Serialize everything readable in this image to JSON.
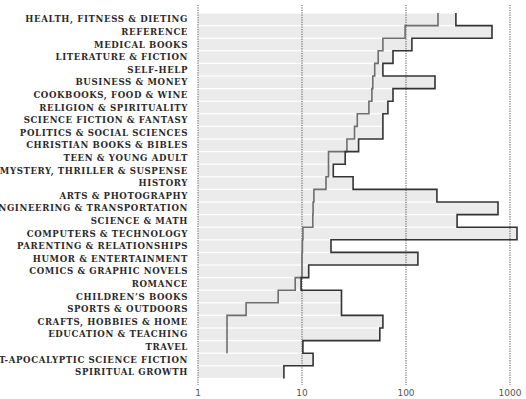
{
  "chart_data": {
    "type": "bar",
    "title": "",
    "xlabel": "",
    "ylabel": "",
    "xscale": "log",
    "xlim": [
      1,
      1000
    ],
    "x_ticks": [
      "1",
      "10",
      "100",
      "1000"
    ],
    "grid": "vertical dotted at each decade",
    "legend": "none",
    "categories": [
      "HEALTH, FITNESS & DIETING",
      "REFERENCE",
      "MEDICAL BOOKS",
      "LITERATURE & FICTION",
      "SELF-HELP",
      "BUSINESS & MONEY",
      "COOKBOOKS, FOOD & WINE",
      "RELIGION & SPIRITUALITY",
      "SCIENCE FICTION & FANTASY",
      "POLITICS & SOCIAL SCIENCES",
      "CHRISTIAN BOOKS & BIBLES",
      "TEEN & YOUNG ADULT",
      "MYSTERY, THRILLER & SUSPENSE",
      "HISTORY",
      "ARTS & PHOTOGRAPHY",
      "ENGINEERING & TRANSPORTATION",
      "SCIENCE & MATH",
      "COMPUTERS & TECHNOLOGY",
      "PARENTING & RELATIONSHIPS",
      "HUMOR & ENTERTAINMENT",
      "COMICS & GRAPHIC NOVELS",
      "ROMANCE",
      "CHILDREN’S BOOKS",
      "SPORTS & OUTDOORS",
      "CRAFTS, HOBBIES & HOME",
      "EDUCATION & TEACHING",
      "TRAVEL",
      "POST-APOCALYPTIC SCIENCE FICTION",
      "SPIRITUAL GROWTH"
    ],
    "series": [
      {
        "name": "gray step line",
        "color": "#6e6e6e",
        "values": [
          203,
          98,
          60,
          54,
          50,
          48,
          47,
          44,
          34,
          32,
          27,
          18,
          18,
          17,
          13,
          12.8,
          12.7,
          10.2,
          10.1,
          10,
          10,
          8.6,
          5.9,
          2.9,
          1.9,
          1.9,
          1.9,
          null,
          null
        ]
      },
      {
        "name": "black step line",
        "color": "#333333",
        "values": [
          302,
          671,
          114,
          75,
          60,
          190,
          75,
          67,
          60,
          60,
          35,
          26,
          20,
          31,
          198,
          767,
          310,
          1168,
          19,
          130,
          11.6,
          9.8,
          24,
          24,
          60,
          56,
          10.2,
          12.8,
          6.7
        ]
      }
    ],
    "bar_fill": "#ebebeb",
    "bar_extent": "max of both series per row"
  }
}
